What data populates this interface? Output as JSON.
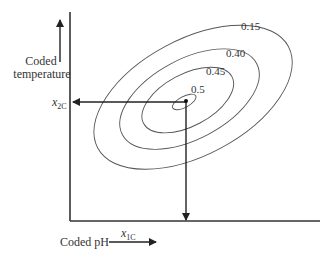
{
  "diagram": {
    "y_axis_label_line1": "Coded",
    "y_axis_label_line2": "temperature",
    "x_axis_label": "Coded pH",
    "x_optimum_label": "x",
    "x_optimum_sub": "1C",
    "y_optimum_label": "x",
    "y_optimum_sub": "2C",
    "contours": [
      {
        "level": "0.15"
      },
      {
        "level": "0.40"
      },
      {
        "level": "0.45"
      },
      {
        "level": "0.5"
      }
    ],
    "colors": {
      "line": "#333333",
      "contour": "#555555",
      "background": "#ffffff"
    }
  }
}
